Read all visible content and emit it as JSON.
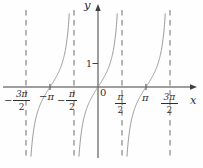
{
  "labels": {
    "y_axis": "y",
    "x_axis": "x",
    "origin": "0",
    "y_one": "1",
    "neg_pi": "−π",
    "pi": "π",
    "neg_3pi_2": {
      "sign": "−",
      "num": "3π",
      "den": "2"
    },
    "neg_pi_2": {
      "sign": "−",
      "num": "π",
      "den": "2"
    },
    "pi_2": {
      "sign": "",
      "num": "π",
      "den": "2"
    },
    "3pi_2": {
      "sign": "",
      "num": "3π",
      "den": "2"
    }
  },
  "chart_data": {
    "type": "line",
    "function": "y = tan(x)",
    "xlabel": "x",
    "ylabel": "y",
    "x_unit": "radians",
    "grid": false,
    "x_range": [
      -5.97,
      6.28
    ],
    "y_range": [
      -3.1,
      3.4
    ],
    "branches": [
      {
        "zero_x": -3.14159,
        "zero_label": "−π",
        "domain": [
          "−3π/2",
          "−π/2"
        ]
      },
      {
        "zero_x": 0,
        "zero_label": "0",
        "domain": [
          "−π/2",
          "π/2"
        ]
      },
      {
        "zero_x": 3.14159,
        "zero_label": "π",
        "domain": [
          "π/2",
          "3π/2"
        ]
      }
    ],
    "asymptotes": [
      {
        "x": -4.71239,
        "label": "−3π/2"
      },
      {
        "x": -1.5708,
        "label": "−π/2"
      },
      {
        "x": 1.5708,
        "label": "π/2"
      },
      {
        "x": 4.71239,
        "label": "3π/2"
      }
    ],
    "x_ticks": [
      {
        "x": -4.71239,
        "label": "−3π/2",
        "tick": false
      },
      {
        "x": -3.14159,
        "label": "−π",
        "tick": true
      },
      {
        "x": -1.5708,
        "label": "−π/2",
        "tick": false
      },
      {
        "x": 0,
        "label": "0",
        "tick": false
      },
      {
        "x": 1.5708,
        "label": "π/2",
        "tick": false
      },
      {
        "x": 3.14159,
        "label": "π",
        "tick": true
      },
      {
        "x": 4.71239,
        "label": "3π/2",
        "tick": false
      }
    ],
    "y_ticks": [
      {
        "y": 1,
        "label": "1"
      }
    ],
    "colors": {
      "axis": "#3f3f3f",
      "curve": "#8f8f8f",
      "asymptote": "#6e6e6e",
      "text": "#2e2e2e",
      "background": "#fefefe"
    }
  }
}
